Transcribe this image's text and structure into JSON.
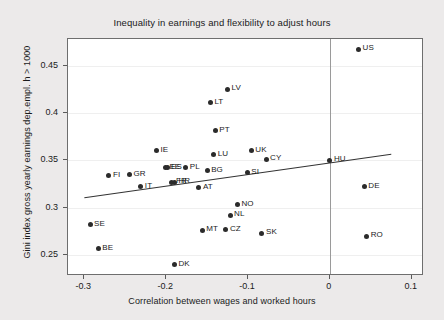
{
  "chart_data": {
    "type": "scatter",
    "title": "Inequality in earnings and flexibility to adjust hours",
    "xlabel": "Correlation between wages and worked hours",
    "ylabel": "Gini index gross yearly earnings dep.empl. h > 1000",
    "xlim": [
      -0.32,
      0.115
    ],
    "ylim": [
      0.228,
      0.478
    ],
    "xticks": [
      -0.3,
      -0.2,
      -0.1,
      0,
      0.1
    ],
    "xtick_labels": [
      "-0.3",
      "-0.2",
      "-0.1",
      "0",
      "0.1"
    ],
    "yticks": [
      0.25,
      0.3,
      0.35,
      0.4,
      0.45
    ],
    "ytick_labels": [
      "0.25",
      "0.3",
      "0.35",
      "0.4",
      "0.45"
    ],
    "grid": "horizontal",
    "legend": "none",
    "marker_color": "#2b2b2b",
    "line_color": "#333333",
    "plot_bg": "#ffffff",
    "figure_bg": "#eceaea",
    "reference_line": {
      "name": "zero-vertical-line",
      "x": 0.0,
      "color": "#9a9a9a"
    },
    "fit_line": {
      "name": "linear-fit",
      "x_start": -0.3,
      "y_start": 0.3105,
      "x_end": 0.075,
      "y_end": 0.3565
    },
    "points": [
      {
        "label": "US",
        "x": 0.035,
        "y": 0.467
      },
      {
        "label": "LV",
        "x": -0.125,
        "y": 0.425
      },
      {
        "label": "LT",
        "x": -0.146,
        "y": 0.411
      },
      {
        "label": "PT",
        "x": -0.14,
        "y": 0.381
      },
      {
        "label": "IE",
        "x": -0.212,
        "y": 0.36
      },
      {
        "label": "UK",
        "x": -0.096,
        "y": 0.36
      },
      {
        "label": "LU",
        "x": -0.142,
        "y": 0.356
      },
      {
        "label": "CY",
        "x": -0.078,
        "y": 0.351
      },
      {
        "label": "HU",
        "x": 0.0,
        "y": 0.35
      },
      {
        "label": "EE",
        "x": -0.201,
        "y": 0.342
      },
      {
        "label": "ES",
        "x": -0.199,
        "y": 0.342
      },
      {
        "label": "PL",
        "x": -0.176,
        "y": 0.342
      },
      {
        "label": "BG",
        "x": -0.15,
        "y": 0.339
      },
      {
        "label": "SI",
        "x": -0.101,
        "y": 0.337
      },
      {
        "label": "GR",
        "x": -0.245,
        "y": 0.335
      },
      {
        "label": "FI",
        "x": -0.27,
        "y": 0.334
      },
      {
        "label": "FR",
        "x": -0.193,
        "y": 0.327
      },
      {
        "label": "HR",
        "x": -0.19,
        "y": 0.327
      },
      {
        "label": "IT",
        "x": -0.231,
        "y": 0.322
      },
      {
        "label": "DE",
        "x": 0.042,
        "y": 0.322
      },
      {
        "label": "AT",
        "x": -0.16,
        "y": 0.321
      },
      {
        "label": "NO",
        "x": -0.113,
        "y": 0.303
      },
      {
        "label": "NL",
        "x": -0.122,
        "y": 0.292
      },
      {
        "label": "SE",
        "x": -0.293,
        "y": 0.282
      },
      {
        "label": "CZ",
        "x": -0.127,
        "y": 0.277
      },
      {
        "label": "MT",
        "x": -0.156,
        "y": 0.276
      },
      {
        "label": "SK",
        "x": -0.083,
        "y": 0.273
      },
      {
        "label": "RO",
        "x": 0.045,
        "y": 0.27
      },
      {
        "label": "BE",
        "x": -0.283,
        "y": 0.257
      },
      {
        "label": "DK",
        "x": -0.19,
        "y": 0.24
      }
    ]
  }
}
